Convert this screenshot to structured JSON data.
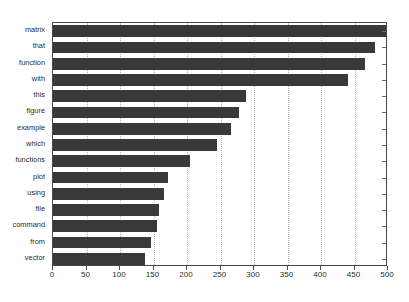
{
  "chart_data": {
    "type": "bar",
    "orientation": "horizontal",
    "title": "",
    "subtitle": "",
    "xlabel": "",
    "ylabel": "",
    "categories": [
      "matrix",
      "that",
      "function",
      "with",
      "this",
      "figure",
      "example",
      "which",
      "functions",
      "plot",
      "using",
      "file",
      "command",
      "from",
      "vector"
    ],
    "values": [
      500,
      480,
      465,
      440,
      288,
      278,
      265,
      245,
      205,
      172,
      165,
      158,
      155,
      146,
      138
    ],
    "xlim": [
      0,
      500
    ],
    "xticks": [
      0,
      50,
      100,
      150,
      200,
      250,
      300,
      350,
      400,
      450,
      500
    ],
    "xtick_labels": [
      "0",
      "50",
      "100",
      "150",
      "200",
      "250",
      "300",
      "350",
      "400",
      "450",
      "500"
    ],
    "grid": true,
    "grid_axis": "x",
    "legend": null,
    "bar_color": "#393939",
    "frame_color": "#4a4a4a",
    "gridline_color": "#b9b9b9",
    "background": "#ffffff"
  }
}
